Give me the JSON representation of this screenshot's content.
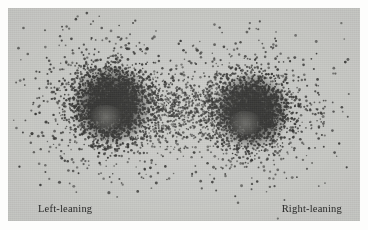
{
  "figure": {
    "kind": "scatter-density-plot",
    "background_color": "#fdfdfc",
    "panel_color": "#c9cac6",
    "point_color": "#2a2a28",
    "panel": {
      "x": 8,
      "y": 8,
      "width": 352,
      "height": 213
    }
  },
  "labels": {
    "left": "Left-leaning",
    "right": "Right-leaning"
  },
  "chart_data": {
    "type": "scatter",
    "title": "",
    "xlabel": "",
    "ylabel": "",
    "xlim": [
      0,
      352
    ],
    "ylim": [
      0,
      213
    ],
    "grid": false,
    "legend": "none",
    "annotations": [
      {
        "text": "Left-leaning",
        "x": 30,
        "y": 195
      },
      {
        "text": "Right-leaning",
        "x": 300,
        "y": 195
      }
    ],
    "point_color": "#2a2a28",
    "point_count_total": 6400,
    "clusters": [
      {
        "name": "Left-leaning",
        "center_x": 104,
        "center_y": 97,
        "core_radius_x": 36,
        "core_radius_y": 34,
        "halo_radius_x": 74,
        "halo_radius_y": 66,
        "core_points": 1850,
        "halo_points": 1150,
        "density": "high"
      },
      {
        "name": "Right-leaning",
        "center_x": 243,
        "center_y": 103,
        "core_radius_x": 34,
        "core_radius_y": 33,
        "halo_radius_x": 68,
        "halo_radius_y": 62,
        "core_points": 1700,
        "halo_points": 1050,
        "density": "high"
      }
    ],
    "bridge": {
      "from_x": 140,
      "to_x": 210,
      "center_y": 100,
      "spread_y": 26,
      "points": 420,
      "density": "low"
    },
    "outliers": {
      "points": 230,
      "spread": "fan outward above and below both clusters",
      "x_range": [
        10,
        345
      ],
      "y_range": [
        8,
        185
      ]
    }
  }
}
